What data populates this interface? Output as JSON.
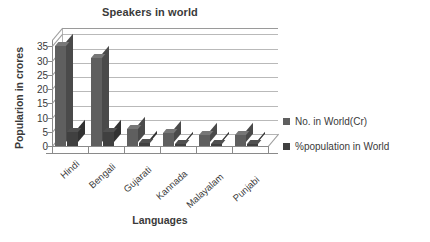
{
  "chart_data": {
    "type": "bar",
    "title": "Speakers in world",
    "xlabel": "Languages",
    "ylabel": "Popularion in crores",
    "categories": [
      "Hindi",
      "Bengali",
      "Gujarati",
      "Kannada",
      "Malayalam",
      "Punjabi"
    ],
    "series": [
      {
        "name": "No. in World(Cr)",
        "color": "#5f5f5f",
        "values": [
          35,
          31,
          6,
          4.5,
          4,
          4
        ]
      },
      {
        "name": "%population in World",
        "color": "#404040",
        "values": [
          5,
          5,
          1,
          0.8,
          0.7,
          0.7
        ]
      }
    ],
    "yticks": [
      0,
      5,
      10,
      15,
      20,
      25,
      30,
      35
    ],
    "ylim": [
      0,
      37.2
    ],
    "grid": true,
    "legend_position": "right",
    "style": "3d-clustered-column"
  }
}
